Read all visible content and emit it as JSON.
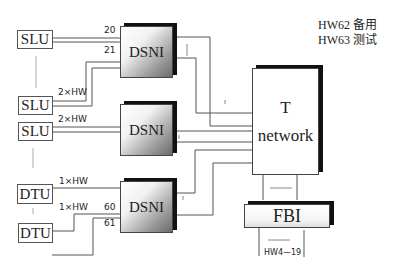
{
  "legend": {
    "line1": "HW62 备用",
    "line2": "HW63 测试"
  },
  "units": {
    "slu_1": "SLU",
    "slu_2": "SLU",
    "slu_3": "SLU",
    "dtu_1": "DTU",
    "dtu_2": "DTU"
  },
  "modules": {
    "dsni_1": "DSNI",
    "dsni_2": "DSNI",
    "dsni_3": "DSNI",
    "t_network_line1": "T",
    "t_network_line2": "network",
    "fbi": "FBI"
  },
  "labels": {
    "port_20": "20",
    "port_21": "21",
    "hw_2x_a": "2×HW",
    "hw_2x_b": "2×HW",
    "hw_1x_a": "1×HW",
    "hw_1x_b": "1×HW",
    "port_60": "60",
    "port_61": "61",
    "fbi_hw": "HW4—19"
  }
}
